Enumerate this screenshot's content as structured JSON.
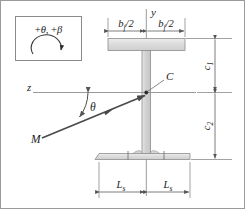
{
  "figure": {
    "type": "engineering-cross-section-diagram",
    "background_color": "#ffffff",
    "line_color": "#6e6e6e",
    "text_color": "#1a1a1a",
    "section_fill": "#d9d9d9",
    "section_fill_light": "#e8e8e8"
  },
  "sign_convention_box": {
    "name": "sign-convention-box",
    "text_plus_theta": "+",
    "symbol_theta": "θ",
    "separator": ", ",
    "text_plus_beta": "+",
    "symbol_beta": "β",
    "full_label": "+θ, +β",
    "arrow": "curved-arrow-clockwise"
  },
  "axes": {
    "vertical": {
      "name": "y-axis",
      "label": "y"
    },
    "horizontal": {
      "name": "z-axis",
      "label": "z"
    }
  },
  "centroid": {
    "name": "centroid-marker",
    "label": "C"
  },
  "moment_vector": {
    "name": "moment-vector-M",
    "label": "M"
  },
  "angle": {
    "name": "angle-theta",
    "label": "θ"
  },
  "dimensions": {
    "top_left": {
      "name": "dimension-bf-half-left",
      "base": "b",
      "subscript": "f",
      "suffix": "/2",
      "full_label": "b_f/2"
    },
    "top_right": {
      "name": "dimension-bf-half-right",
      "base": "b",
      "subscript": "f",
      "suffix": "/2",
      "full_label": "b_f/2"
    },
    "right_upper": {
      "name": "dimension-c1",
      "base": "c",
      "subscript": "1",
      "full_label": "c_1"
    },
    "right_lower": {
      "name": "dimension-c2",
      "base": "c",
      "subscript": "2",
      "full_label": "c_2"
    },
    "bottom_left": {
      "name": "dimension-Ls-left",
      "base": "L",
      "subscript": "s",
      "full_label": "L_s"
    },
    "bottom_right": {
      "name": "dimension-Ls-right",
      "base": "L",
      "subscript": "s",
      "full_label": "L_s"
    }
  }
}
